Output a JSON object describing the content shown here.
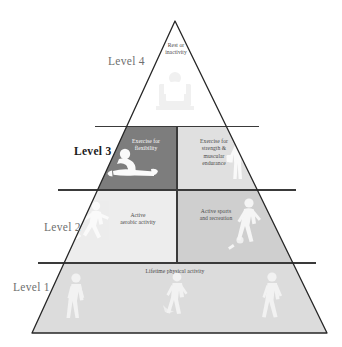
{
  "figure": {
    "background_color": "#ffffff",
    "outline_color": "#262626"
  },
  "levels": [
    {
      "id": "level-4",
      "label": "Level 4",
      "bold": false,
      "label_color": "#6f6f6f",
      "boxes": [
        {
          "id": "rest-inactivity",
          "text": "Rest or\ninactivity",
          "fill": "#f2f2f2",
          "text_color": "#4a4a4a",
          "silhouette": "person-sitting-watching-tv"
        }
      ]
    },
    {
      "id": "level-3",
      "label": "Level 3",
      "bold": true,
      "label_color": "#1a1a1a",
      "boxes": [
        {
          "id": "exercise-flexibility",
          "text": "Exercise for\nflexibility",
          "fill": "#7d7d7d",
          "text_color": "#ffffff",
          "silhouette": "person-stretching"
        },
        {
          "id": "exercise-strength",
          "text": "Exercise for\nstrength &\nmuscular\nendurance",
          "fill": "#e0e0e0",
          "text_color": "#4a4a4a",
          "silhouette": "person-lifting-weights"
        }
      ]
    },
    {
      "id": "level-2",
      "label": "Level 2",
      "bold": false,
      "label_color": "#6f6f6f",
      "boxes": [
        {
          "id": "active-aerobic",
          "text": "Active\naerobic activity",
          "fill": "#ededed",
          "text_color": "#4a4a4a",
          "silhouette": "person-running"
        },
        {
          "id": "active-sports",
          "text": "Active sports\nand recreation",
          "fill": "#cfcfcf",
          "text_color": "#4a4a4a",
          "silhouette": "person-playing-sport"
        }
      ]
    },
    {
      "id": "level-1",
      "label": "Level 1",
      "bold": false,
      "label_color": "#6f6f6f",
      "boxes": [
        {
          "id": "lifetime-activity",
          "text": "Lifetime physical activity",
          "fill": "#dcdcdc",
          "text_color": "#4a4a4a",
          "silhouette": "people-walking-and-gardening"
        }
      ]
    }
  ]
}
